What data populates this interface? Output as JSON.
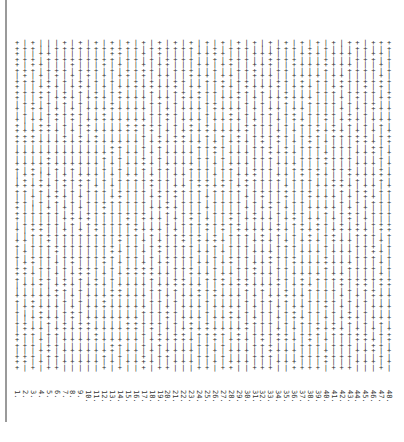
{
  "document": {
    "orientation": "rotated-90",
    "line_count": 48,
    "chars_per_line": 60,
    "glyphs": [
      "+",
      "|"
    ],
    "lines": [
      {
        "label": "1.",
        "text": "++++++|++++|+|+++++|+|++||++|++++|+|++|+|+++||++|+|+|+++|+++"
      },
      {
        "label": "2.",
        "text": "|+|+|+++|+|+|+||+++|+|+|++++|+|+|+||+|+|+++|+|+|+||+++|+|++|+"
      },
      {
        "label": "3.",
        "text": "++|+++|+|+|++|+|+++|+|+++|+|+||+|+++|+|++|+|+|+++|+|++|+|+|++"
      },
      {
        "label": "4.",
        "text": "||+|+|+|+++|+|+++|+|+|+||+++|+|+|+++|+|+|+|++|+|+++|+|+|+|+|+"
      },
      {
        "label": "5.",
        "text": "||++|+|+++|+|+|++|+|+++|+|+|+|++|+|+++|+|+|+||+|+|++|+|+++|++"
      },
      {
        "label": "6.",
        "text": "|+|+|++|+|+|+++|+|+|+|++|+|+++|+|+|+|++|+|+|+++|+|+|++|+|+|++"
      },
      {
        "label": "7.",
        "text": "++|+|+|+|+++|+|+|++|+|+|+++|+|+|+|++|+|+|+|+++|+|+|++|+|+|+|+"
      },
      {
        "label": "8.",
        "text": "|+|++|+|+|+|+++|+|+|+|++|+|+|+|+++|+|+|++|+|+|+|+++|+|+|+|+|+"
      },
      {
        "label": "9.",
        "text": "++|+|+|+++|+|+|+|++|+|+|+++|+|+|+|++|+|+|+++|+|+|+|++|+|+|+|+"
      },
      {
        "label": "10.",
        "text": "|+|+|++|+|+|+|+++|+|+|+|++|+|+|+++|+|+|+|++|+|+|+|+++|+|+|+|++"
      },
      {
        "label": "11.",
        "text": "++|+|+|+|++|+|+|+++|+|+|+|++|+|+|+++|+|+|+|++|+|+|+|+++|+|+|++"
      },
      {
        "label": "12.",
        "text": "|+|++|+|+|+|+++|+|+|++|+|+|+|+++|+|+|+|++|+|+|+++|+|+|+|++|+|+"
      },
      {
        "label": "13.",
        "text": "++++|+|+|+|++|+|+|+++|+|+|+|++|+|+|+|+++|+|+|++|+|+|+|+++|+|++"
      },
      {
        "label": "14.",
        "text": "|++|+|+|+++|+|+|+|++|+|+|+|+++|+|+|++|+|+|+|+++|+|+|+|++|+|+|+"
      },
      {
        "label": "15.",
        "text": "++|+|++|+|+|+|+++|+|+|+|++|+|+|+++|+|+|+|++|+|+|+|+++|+|+|+|++"
      },
      {
        "label": "16.",
        "text": "|+|+|+|++|+|+|+++|+|+|+|++|+|+|+|+++|+|+|++|+|+|+|+++|+|+|+|++"
      },
      {
        "label": "17.",
        "text": "+|+|+++|+|+|+|++|+|+|+++|+|+|+|++|+|+|+|+++|+|+|++|+|+|+|+++|+"
      },
      {
        "label": "18.",
        "text": "|+|+|+|+++|+|+|++|+|+|+|+++|+|+|+|++|+|+|+++|+|+|+|++|+|+|+|++"
      },
      {
        "label": "19.",
        "text": "+++|+|+|+|++|+|+|+++|+|+|+|++|+|+|+|+++|+|+|++|+|+|+|+++|+|+|+"
      },
      {
        "label": "20.",
        "text": "|+|++|+|+|+|+++|+|+|+|++|+|+|+++|+|+|+|++|+|+|+|+++|+|+|++|+|+"
      },
      {
        "label": "21.",
        "text": "++|+|+|+++|+|+|+|++|+|+|+|+++|+|+|++|+|+|+|+++|+|+|+|++|+|+|++"
      },
      {
        "label": "22.",
        "text": "|+|+|+|+|++|+|+|+++|+|+|+|++|+|+|+|+++|+|+|++|+|+|+|+++|+|+|++"
      },
      {
        "label": "23.",
        "text": "++|+|++|+|+|+|+++|+|+|++|+|+|+|+++|+|+|+|++|+|+|+|+++|+|+|+|++"
      },
      {
        "label": "24.",
        "text": "||+|+|+|+++|+|+|+|++|+|+|+++|+|+|+|++|+|+|+|+++|+|+|++|+|+|+|+"
      },
      {
        "label": "25.",
        "text": "+|+|+|++|+|+|+|+++|+|+|+|++|+|+|+++|+|+|+|++|+|+|+|+++|+|+|+|+"
      },
      {
        "label": "26.",
        "text": "|+++|+|+|+|++|+|+|+++|+|+|++|+|+|+|+++|+|+|+|++|+|+|+++|+|+|++"
      },
      {
        "label": "27.",
        "text": "+|+|+|+++|+|+|+|++|+|+|+|+++|+|+|++|+|+|+|+++|+|+|+|++|+|+|+|+"
      },
      {
        "label": "28.",
        "text": "|+|++|+|+|+|+++|+|+|+|++|+|+|+|+++|+|+|++|+|+|+|+++|+|+|+|++|+"
      },
      {
        "label": "29.",
        "text": "++|+|+|+|++|+|+|+++|+|+|+|++|+|+|+++|+|+|+|++|+|+|+|+++|+|+|++"
      },
      {
        "label": "30.",
        "text": "|+|+|+|+++|+|+|++|+|+|+|+++|+|+|+|++|+|+|+|+++|+|+|++|+|+|+|++"
      },
      {
        "label": "31.",
        "text": "+|+|+++|+|+|+|++|+|+|+|+++|+|+|++|+|+|+|+++|+|+|+|++|+|+|+|+|+"
      },
      {
        "label": "32.",
        "text": "||+|+|+|++|+|+|+|+++|+|+|+|++|+|+|+++|+|+|+|++|+|+|+|+++|+|+|+"
      },
      {
        "label": "33.",
        "text": "+|+++|+|+|+|++|+|+|+++|+|+|+|++|+|+|+|+++|+|+|++|+|+|+|+++|+|+"
      },
      {
        "label": "34.",
        "text": "|+|+|+|++|+|+|+|+++|+|+|++|+|+|+|+++|+|+|+|++|+|+|+|+++|+|+|++"
      },
      {
        "label": "35.",
        "text": "++|+|+|+|+++|+|+|+|++|+|+|+++|+|+|+|++|+|+|+|+++|+|+|++|+|+|++"
      },
      {
        "label": "36.",
        "text": "|+|++|+|+|+|+++|+|+|+|++|+|+|+|+++|+|+|++|+|+|+|+++|+|+|+|++|+"
      },
      {
        "label": "37.",
        "text": "+|+|+|+++|+|+|++|+|+|+|+++|+|+|+|++|+|+|+|+++|+|+|++|+|+|+|+|+"
      },
      {
        "label": "38.",
        "text": "|++|+|+|+|++|+|+|+++|+|+|+|++|+|+|+++|+|+|+|++|+|+|+|+++|+|+|+"
      },
      {
        "label": "39.",
        "text": "+|+|+|++|+|+|+|+++|+|+|++|+|+|+|+++|+|+|+|++|+|+|+|+++|+|+|+|+"
      },
      {
        "label": "40.",
        "text": "|+|+++|+|+|+|++|+|+|+++|+|+|+|++|+|+|+|+++|+|+|++|+|+|+|+++|++"
      },
      {
        "label": "41.",
        "text": "+|+|+|+|++|+|+|+++|+|+|+|++|+|+|+|+++|+|+|++|+|+|+|+++|+|+|+|+"
      },
      {
        "label": "42.",
        "text": "||+|+|+++|+|+|+|++|+|+|+|+++|+|+|++|+|+|+|+++|+|+|+|++|+|+|+|+"
      },
      {
        "label": "43.",
        "text": "+|+|++|+|+|+|+++|+|+|+|++|+|+|+++|+|+|+|++|+|+|+|+++|+|+|+|+|+"
      },
      {
        "label": "44.",
        "text": "++|+|+|+|++|+|+|+++|+|+|++|+|+|+|+++|+|+|+|++|+|+|+|+++|+|+|++"
      },
      {
        "label": "45.",
        "text": "|+|+|+|+++|+|+|+|++|+|+|+|+++|+|+|++|+|+|+|+++|+|+|+|++|+|+|++"
      },
      {
        "label": "46.",
        "text": "+|++|+|+|+|++|+|+|+++|+|+|+|++|+|+|+|+++|+|+|++|+|+|+|+++|+|++"
      },
      {
        "label": "47.",
        "text": "+|+|+|+++|+|+|++|+|+|+|+++|+|+|+|++|+|+|+|+++|+|+|++|+|+|+|+|+"
      },
      {
        "label": "48.",
        "text": "++|+|+|+|++|+|+|+++|+|+|+|++|+|+|+++|+|+|+|++|+|+|+|+++|+|+|++"
      }
    ]
  },
  "colors": {
    "background": "#ffffff",
    "text": "#2a2a2a",
    "border_line": "#9a9a9a"
  }
}
